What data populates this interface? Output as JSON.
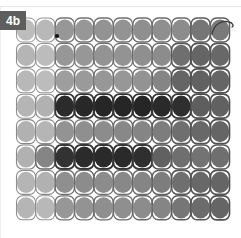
{
  "panel": {
    "label": "4b",
    "label_bg": "#5e5e5e",
    "label_fg": "#ffffff",
    "background": "#ffffff",
    "width": 241,
    "height": 238
  },
  "chart_data": {
    "type": "heatmap",
    "title": "4b",
    "xlabel": "",
    "ylabel": "",
    "grid": true,
    "legend": "none",
    "columns": 11,
    "rows": 8,
    "col_labels": [
      "c1",
      "c2",
      "c3",
      "c4",
      "c5",
      "c6",
      "c7",
      "c8",
      "c9",
      "c10",
      "c11"
    ],
    "row_labels": [
      "r1",
      "r2",
      "r3",
      "r4",
      "r5",
      "r6",
      "r7",
      "r8"
    ],
    "value_scale": {
      "min": 0,
      "max": 100,
      "note": "0 = lightest (#d2d2d2), 100 = darkest (#1e1e1e)"
    },
    "palette": {
      "lightest": "#d2d2d2",
      "light": "#c6c6c6",
      "mid_light": "#b4b4b4",
      "mid": "#9a9a9a",
      "mid_dark": "#6f6f6f",
      "dark": "#3c3c3c",
      "darkest": "#1e1e1e",
      "outline_light": "#cfcfcf",
      "outline_dark": "#303030",
      "tail": "#3a3a3a",
      "marker": "#101010"
    },
    "values": [
      [
        10,
        12,
        30,
        30,
        32,
        32,
        34,
        34,
        36,
        48,
        46
      ],
      [
        14,
        10,
        30,
        30,
        32,
        32,
        34,
        36,
        52,
        58,
        56
      ],
      [
        12,
        10,
        26,
        28,
        30,
        30,
        32,
        40,
        58,
        60,
        58
      ],
      [
        14,
        16,
        92,
        94,
        95,
        95,
        95,
        93,
        90,
        62,
        60
      ],
      [
        16,
        14,
        32,
        34,
        36,
        38,
        40,
        44,
        52,
        56,
        58
      ],
      [
        16,
        40,
        88,
        92,
        93,
        93,
        90,
        60,
        52,
        50,
        52
      ],
      [
        14,
        16,
        34,
        36,
        36,
        38,
        40,
        44,
        52,
        56,
        58
      ],
      [
        14,
        12,
        30,
        32,
        34,
        34,
        36,
        40,
        48,
        54,
        58
      ]
    ],
    "row_offsets_px": [
      0,
      10,
      0,
      6,
      0,
      8,
      0,
      10
    ],
    "cell_geometry": {
      "cell_width": 19,
      "cell_height": 24,
      "col_pitch": 19.4,
      "row_pitch": 25.4,
      "corner_radius": 6,
      "core_rx": 9.3,
      "core_ry": 10.6,
      "origin_x": 26,
      "origin_y": 30
    },
    "annotations": [
      {
        "name": "marker-dot",
        "kind": "dot",
        "row": 1,
        "col": 2,
        "x": 57,
        "y": 36,
        "r": 2.1,
        "color": "#101010"
      },
      {
        "name": "tail-whisker",
        "kind": "curve",
        "from_row": 1,
        "from_col": 11,
        "path": "M 212 34 C 214 24, 222 20, 229 22 C 233 23, 234 26, 232 27",
        "color": "#3a3a3a",
        "width": 1.3
      }
    ]
  }
}
